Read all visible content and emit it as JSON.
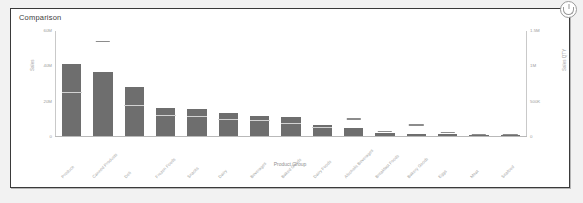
{
  "widget": {
    "title": "Comparison",
    "badge_icon": "info-circle-icon"
  },
  "chart_data": {
    "type": "bar",
    "title": "Comparison",
    "xlabel": "Product Group",
    "ylabel": "Sales",
    "y2label": "Sales QTY",
    "grid": false,
    "legend": "none",
    "ylim": [
      0,
      60000000
    ],
    "y2lim": [
      0,
      1500000
    ],
    "yticks": [
      "0",
      "20M",
      "40M",
      "60M"
    ],
    "ytick_values": [
      0,
      20000000,
      40000000,
      60000000
    ],
    "y2ticks": [
      "0",
      "500K",
      "1M",
      "1.5M"
    ],
    "y2tick_values": [
      0,
      500000,
      1000000,
      1500000
    ],
    "categories": [
      "Produce",
      "Canned Products",
      "Deli",
      "Frozen Foods",
      "Snacks",
      "Dairy",
      "Beverages",
      "Baked Goods",
      "Dairy Foods",
      "Alcoholic Beverages",
      "Breakfast Foods",
      "Bakery Goods",
      "Eggs",
      "Meat",
      "Seafood"
    ],
    "series": [
      {
        "name": "Sales",
        "axis": "left",
        "values": [
          41000000,
          36500000,
          28000000,
          16000000,
          15500000,
          13000000,
          11500000,
          10500000,
          6500000,
          4500000,
          1500000,
          1200000,
          900000,
          300000,
          200000
        ]
      },
      {
        "name": "Sales QTY",
        "axis": "right",
        "values": [
          610000,
          1330000,
          430000,
          280000,
          265000,
          230000,
          215000,
          165000,
          110000,
          230000,
          55000,
          145000,
          40000,
          15000,
          10000
        ]
      }
    ]
  }
}
